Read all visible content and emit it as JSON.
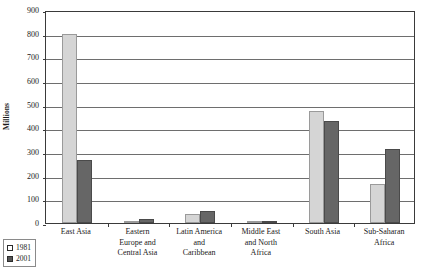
{
  "chart_data": {
    "type": "bar",
    "title": "",
    "subtitle": "",
    "xlabel": "",
    "ylabel": "Millions",
    "ylim": [
      0,
      900
    ],
    "ytick_step": 100,
    "ytick_labels": [
      "900",
      "800",
      "700",
      "600",
      "500",
      "400",
      "300",
      "200",
      "100",
      "0"
    ],
    "grid": true,
    "legend_position": "bottom-left",
    "categories": [
      "East Asia",
      "Eastern Europe and Central Asia",
      "Latin America and Caribbean",
      "Middle East and North Africa",
      "South Asia",
      "Sub-Saharan Africa"
    ],
    "category_lines": [
      [
        "East Asia"
      ],
      [
        "Eastern",
        "Europe and",
        "Central Asia"
      ],
      [
        "Latin America",
        "and",
        "Caribbean"
      ],
      [
        "Middle East",
        "and North",
        "Africa"
      ],
      [
        "South Asia"
      ],
      [
        "Sub-Saharan",
        "Africa"
      ]
    ],
    "series": [
      {
        "name": "1981",
        "color": "#d5d5d5",
        "values": [
          800,
          5,
          37,
          7,
          475,
          163
        ]
      },
      {
        "name": "2001",
        "color": "#666666",
        "values": [
          265,
          18,
          50,
          8,
          430,
          313
        ]
      }
    ]
  },
  "legend": {
    "entries": [
      {
        "label": "1981"
      },
      {
        "label": "2001"
      }
    ]
  }
}
